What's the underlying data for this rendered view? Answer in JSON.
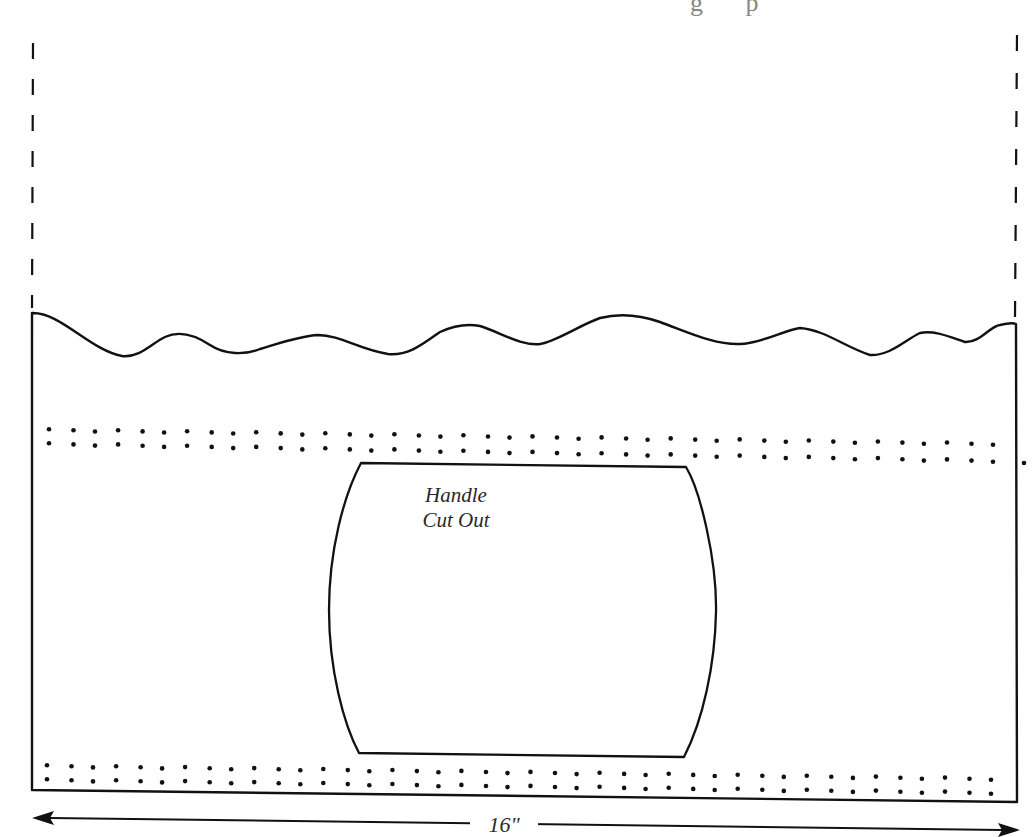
{
  "title_fragment": "g p",
  "pattern": {
    "name": "bag-panel-pattern",
    "handle_label_line1": "Handle",
    "handle_label_line2": "Cut Out",
    "width_label": "16\"",
    "width_inches": 16
  },
  "colors": {
    "line": "#111111",
    "text": "#2a2a2a",
    "background": "#ffffff"
  },
  "elements": {
    "fold_lines": [
      "left-dashed-extension",
      "right-dashed-extension"
    ],
    "scalloped_top_edge": true,
    "dot_rows": [
      {
        "position": "upper",
        "rows": 2
      },
      {
        "position": "lower",
        "rows": 2
      }
    ],
    "handle_cutout": "barrel-shaped opening",
    "dimension_arrow": "double-headed horizontal"
  }
}
